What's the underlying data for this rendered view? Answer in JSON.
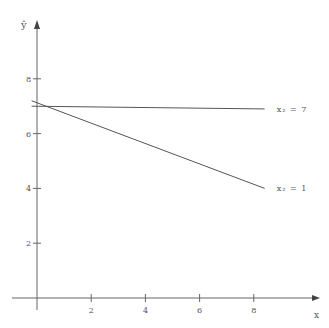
{
  "chart_data": {
    "type": "line",
    "title": "",
    "xlabel": "x",
    "ylabel": "ŷ",
    "xlim": [
      0,
      8.4
    ],
    "ylim": [
      0,
      9.5
    ],
    "x_ticks": [
      2,
      4,
      6,
      8
    ],
    "y_ticks": [
      2,
      4,
      6,
      8
    ],
    "grid": false,
    "legend_position": "inline-right",
    "series": [
      {
        "name": "x₂ = 7",
        "label": "x₂ = 7",
        "x": [
          -0.2,
          8.4
        ],
        "y": [
          7.0,
          6.9
        ]
      },
      {
        "name": "x₂ = 1",
        "label": "x₂ = 1",
        "x": [
          -0.2,
          8.4
        ],
        "y": [
          7.2,
          4.0
        ]
      }
    ]
  },
  "axes": {
    "x_label": "x",
    "y_label": "ŷ",
    "x_tick_labels": [
      "2",
      "4",
      "6",
      "8"
    ],
    "y_tick_labels": [
      "2",
      "4",
      "6",
      "8"
    ]
  },
  "colors": {
    "axis": "#666666",
    "line": "#555555",
    "text": "#555555"
  }
}
